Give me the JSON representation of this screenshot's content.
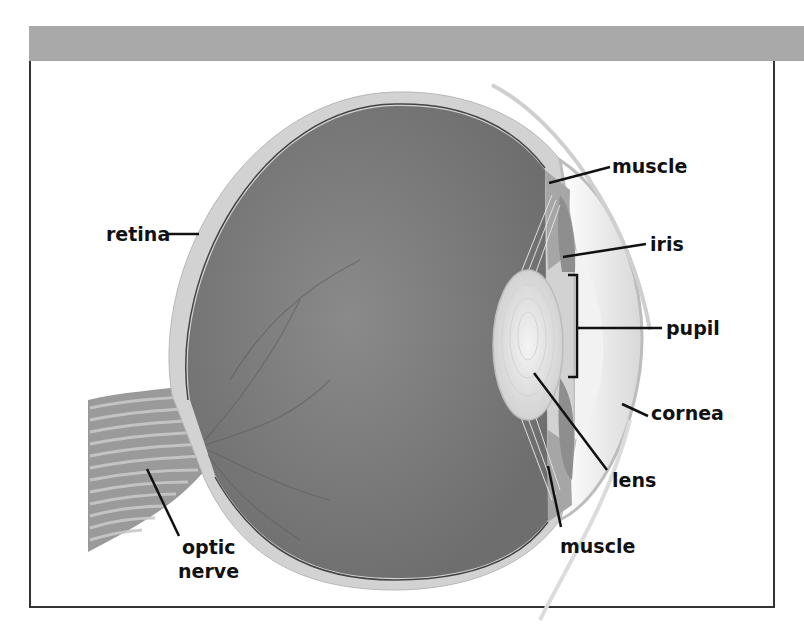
{
  "figure": {
    "colors": {
      "header_bar": "#a9a9a9",
      "frame_border": "#333333",
      "vitreous": "#7c7c7c",
      "sclera": "#d2d2d2",
      "lens": "#e6e6e6",
      "label_text": "#111111"
    },
    "labels": [
      {
        "id": "muscle-top",
        "text": "muscle"
      },
      {
        "id": "iris",
        "text": "iris"
      },
      {
        "id": "pupil",
        "text": "pupil"
      },
      {
        "id": "cornea",
        "text": "cornea"
      },
      {
        "id": "lens",
        "text": "lens"
      },
      {
        "id": "muscle-bottom",
        "text": "muscle"
      },
      {
        "id": "retina",
        "text": "retina"
      },
      {
        "id": "optic-nerve-line1",
        "text": "optic"
      },
      {
        "id": "optic-nerve-line2",
        "text": "nerve"
      }
    ]
  }
}
